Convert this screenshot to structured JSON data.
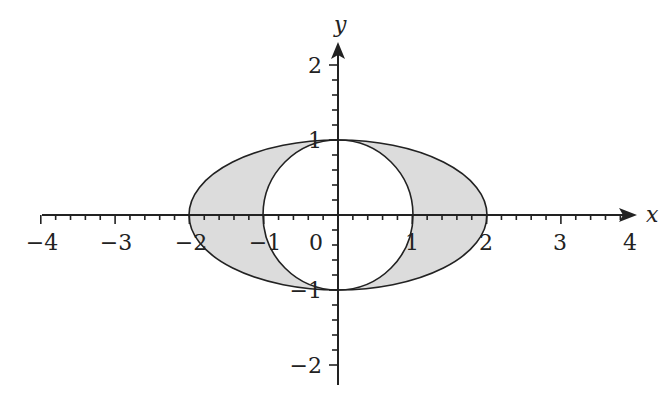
{
  "chart_data": {
    "type": "area",
    "title": "",
    "xlabel": "x",
    "ylabel": "y",
    "xlim": [
      -4,
      4
    ],
    "ylim": [
      -2,
      2
    ],
    "grid": false,
    "x_ticks": [
      "−4",
      "−3",
      "−2",
      "−1",
      "0",
      "1",
      "2",
      "3",
      "4"
    ],
    "y_ticks": [
      "2",
      "1",
      "−1",
      "−2"
    ],
    "curves": [
      {
        "name": "ellipse",
        "equation": "x^2/4 + y^2 = 1",
        "a": 2,
        "b": 1
      },
      {
        "name": "circle",
        "equation": "x^2 + y^2 = 1",
        "r": 1
      }
    ],
    "shaded_region": "Region inside ellipse and outside unit circle",
    "colors": {
      "fill": "#d9d9d9",
      "stroke": "#222222"
    }
  }
}
